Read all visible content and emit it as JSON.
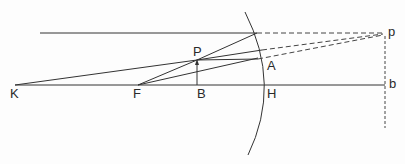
{
  "diagram": {
    "title": "",
    "type": "concave-mirror-ray-diagram",
    "colors": {
      "line": "#333333",
      "background": "#fdfdfd"
    },
    "labels": {
      "K": "K",
      "F": "F",
      "B": "B",
      "H": "H",
      "P": "P",
      "A": "A",
      "p": "p",
      "b": "b"
    },
    "points": {
      "K": [
        15,
        85
      ],
      "F": [
        138,
        85
      ],
      "B": [
        197,
        85
      ],
      "P": [
        197,
        60
      ],
      "H": [
        265,
        85
      ],
      "A": [
        258,
        58
      ],
      "p": [
        383,
        34
      ],
      "b": [
        385,
        85
      ]
    }
  }
}
